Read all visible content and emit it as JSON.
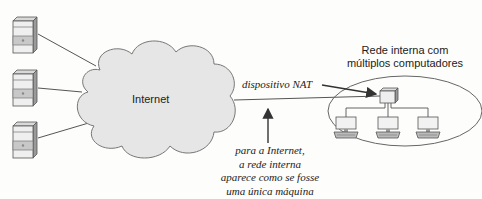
{
  "diagram": {
    "cloud_label": "Internet",
    "nat_label": "dispositivo NAT",
    "internal_network_label": [
      "Rede interna com",
      "múltiplos computadores"
    ],
    "caption": [
      "para a Internet,",
      "a rede interna",
      "aparece como se fosse",
      "uma única máquina"
    ],
    "servers_count": 3,
    "internal_computers_count": 3,
    "colors": {
      "cloud_fill": "#e6e6e6",
      "line": "#555555",
      "text": "#222222"
    }
  }
}
